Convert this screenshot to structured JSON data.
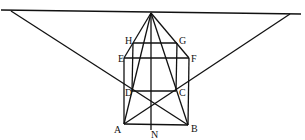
{
  "diagram": {
    "type": "perspective-geometry",
    "points": {
      "V": {
        "x": 151,
        "y": 13
      },
      "L": {
        "x": 11,
        "y": 11
      },
      "R": {
        "x": 290,
        "y": 14
      },
      "A": {
        "x": 124,
        "y": 124
      },
      "B": {
        "x": 188,
        "y": 125
      },
      "N": {
        "x": 151,
        "y": 130
      },
      "D": {
        "x": 132,
        "y": 91
      },
      "C": {
        "x": 176,
        "y": 91
      },
      "E": {
        "x": 124,
        "y": 58
      },
      "F": {
        "x": 189,
        "y": 58
      },
      "H": {
        "x": 133,
        "y": 43
      },
      "G": {
        "x": 177,
        "y": 43
      }
    },
    "labels": {
      "A": "A",
      "B": "B",
      "N": "N",
      "C": "C",
      "D": "D",
      "E": "E",
      "F": "F",
      "G": "G",
      "H": "H"
    },
    "line_color": "#111111"
  }
}
